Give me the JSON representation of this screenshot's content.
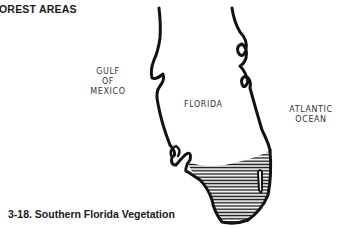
{
  "heading": "FOREST AREAS",
  "heading_visible": "OREST AREAS",
  "map": {
    "labels": {
      "gulf_line1": "GULF",
      "gulf_line2": "OF",
      "gulf_line3": "MEXICO",
      "state": "FLORIDA",
      "ocean_line1": "ATLANTIC",
      "ocean_line2": "OCEAN"
    },
    "hatched_region": "southern tip of Florida",
    "colors": {
      "ink": "#111111",
      "background": "#ffffff"
    }
  },
  "caption": "3-18. Southern Florida Vegetation"
}
